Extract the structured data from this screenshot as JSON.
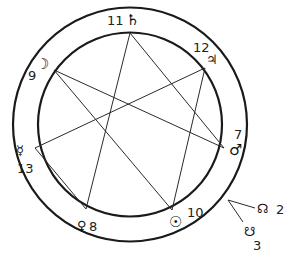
{
  "diagram": {
    "planets": [
      {
        "name": "Saturn",
        "symbol": "♄",
        "number": "11"
      },
      {
        "name": "Jupiter",
        "symbol": "♃",
        "number": "12"
      },
      {
        "name": "Mars",
        "symbol": "♂",
        "number": "7"
      },
      {
        "name": "Sun",
        "symbol": "☉",
        "number": "10"
      },
      {
        "name": "Venus",
        "symbol": "♀",
        "number": "8"
      },
      {
        "name": "Mercury",
        "symbol": "☿",
        "number": "13"
      },
      {
        "name": "Moon",
        "symbol": "☽",
        "number": "9"
      }
    ],
    "nodes": [
      {
        "name": "North Node",
        "symbol": "☊",
        "number": "2"
      },
      {
        "name": "South Node",
        "symbol": "☋",
        "number": "3"
      }
    ],
    "star_type": "{7/3} heptagram"
  }
}
